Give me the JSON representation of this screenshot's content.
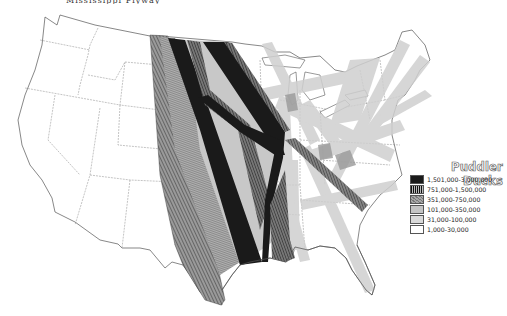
{
  "title": {
    "text": "Mississippi Flyway",
    "visible": "partially cropped at top edge"
  },
  "legend": {
    "title": "Puddler Ducks",
    "items": [
      {
        "label": "1,501,000-3,000,000",
        "fill": "#1a1a1a",
        "pattern": "solid-black"
      },
      {
        "label": "751,000-1,500,000",
        "fill": "#4a4a4a",
        "pattern": "vertical-hatch"
      },
      {
        "label": "351,000-750,000",
        "fill": "#8c8c8c",
        "pattern": "diagonal-hatch"
      },
      {
        "label": "101,000-350,000",
        "fill": "#c4c4c4",
        "pattern": "light-gray"
      },
      {
        "label": "31,000-100,000",
        "fill": "#d9d9d9",
        "pattern": "lighter-gray"
      },
      {
        "label": "1,000-30,000",
        "fill": "#ffffff",
        "pattern": "white"
      }
    ]
  },
  "map": {
    "region": "Contiguous United States",
    "outline_color": "#555555",
    "state_line_color": "#777777",
    "corridors": [
      {
        "name": "western-plains-corridor",
        "class": "351,000-750,000"
      },
      {
        "name": "central-plains-corridor-1",
        "class": "1,501,000-3,000,000"
      },
      {
        "name": "central-plains-corridor-2",
        "class": "1,501,000-3,000,000"
      },
      {
        "name": "mississippi-valley-corridor",
        "class": "1,501,000-3,000,000"
      },
      {
        "name": "plains-cross-corridor",
        "class": "751,000-1,500,000"
      },
      {
        "name": "midwest-to-atlantic-corridor",
        "class": "751,000-1,500,000"
      },
      {
        "name": "great-lakes-corridors",
        "class": "101,000-350,000"
      },
      {
        "name": "atlantic-coast-corridors",
        "class": "31,000-100,000"
      }
    ]
  }
}
